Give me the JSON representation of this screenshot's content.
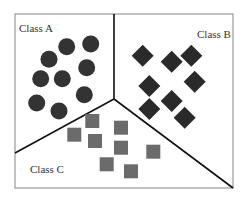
{
  "diagram": {
    "type": "classification-regions",
    "frame": {
      "x": 15,
      "y": 14,
      "width": 218,
      "height": 174,
      "stroke": "#9a9a9a"
    },
    "divider_color": "#111111",
    "junction": {
      "x": 114,
      "y": 99
    },
    "dividers": [
      {
        "name": "divider-a-b",
        "x1": 114,
        "y1": 14,
        "x2": 114,
        "y2": 99
      },
      {
        "name": "divider-a-c",
        "x1": 114,
        "y1": 99,
        "x2": 15,
        "y2": 153
      },
      {
        "name": "divider-b-c",
        "x1": 114,
        "y1": 99,
        "x2": 233,
        "y2": 188
      }
    ],
    "classes": [
      {
        "label": "Class A",
        "label_pos": {
          "x": 19,
          "y": 32
        },
        "shape": "circle",
        "color": "#333333",
        "radius": 8.5,
        "points": [
          [
            66.7,
            46.7
          ],
          [
            90.7,
            44
          ],
          [
            49,
            59.3
          ],
          [
            86.7,
            67.7
          ],
          [
            40.7,
            78.7
          ],
          [
            62.3,
            78.7
          ],
          [
            84.3,
            94.7
          ],
          [
            36.7,
            103
          ],
          [
            59,
            111
          ]
        ]
      },
      {
        "label": "Class B",
        "label_pos": {
          "x": 197,
          "y": 38
        },
        "shape": "diamond",
        "color": "#2a2a2a",
        "half_diag": 11,
        "points": [
          [
            142.7,
            55.7
          ],
          [
            171.7,
            61.7
          ],
          [
            191.3,
            55.7
          ],
          [
            149.3,
            86
          ],
          [
            194.7,
            81.7
          ],
          [
            171.7,
            101
          ],
          [
            149.3,
            109
          ],
          [
            184.7,
            117.7
          ]
        ]
      },
      {
        "label": "Class C",
        "label_pos": {
          "x": 30,
          "y": 173
        },
        "shape": "square",
        "color": "#6b6b6b",
        "size": 14,
        "points": [
          [
            92.3,
            121
          ],
          [
            74.3,
            134.7
          ],
          [
            95,
            141
          ],
          [
            121,
            127.7
          ],
          [
            121,
            147.7
          ],
          [
            153.3,
            151.7
          ],
          [
            106.7,
            164.3
          ],
          [
            131,
            171.3
          ]
        ]
      }
    ]
  }
}
